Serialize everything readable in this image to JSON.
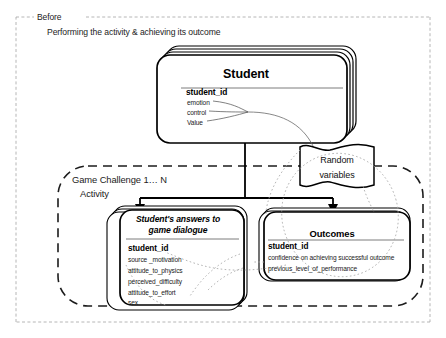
{
  "diagram": {
    "scope": {
      "frame_label": "Before",
      "subtitle": "Performing the activity & achieving its outcome"
    },
    "activity": {
      "line1": "Game Challenge  1… N",
      "line2": "Activity"
    },
    "entities": {
      "student": {
        "title": "Student",
        "key": "student_id",
        "attributes": [
          "emotion",
          "control",
          "Value"
        ]
      },
      "answers": {
        "title_line1": "Student's answers to",
        "title_line2": "game dialogue",
        "key": "student_id",
        "attributes": [
          "source _motivation",
          "attitude_to_physics",
          "perceived_difficulty",
          "attitude_to_effort",
          "sex"
        ]
      },
      "outcomes": {
        "title": "Outcomes",
        "key": "student_id",
        "attributes": [
          "confidence on achieving successful outcome",
          "previous_level_of_performance"
        ]
      }
    },
    "note": {
      "line1": "Random",
      "line2": "variables"
    },
    "colors": {
      "stroke": "#000000",
      "outer_frame": "#9a9a9a",
      "activity_frame": "#1a1a1a",
      "dotted_relation": "#9d9d9d",
      "background": "#ffffff"
    }
  }
}
